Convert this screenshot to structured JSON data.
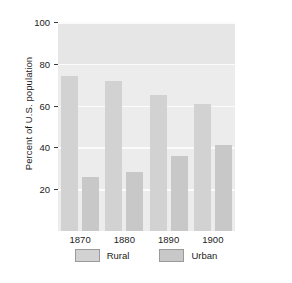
{
  "chart_data": {
    "type": "bar",
    "title": "",
    "xlabel": "",
    "ylabel": "Percent of U.S. population",
    "categories": [
      "1870",
      "1880",
      "1890",
      "1900"
    ],
    "series": [
      {
        "name": "Rural",
        "color": "#d2d2d2",
        "values": [
          74,
          72,
          65,
          61
        ]
      },
      {
        "name": "Urban",
        "color": "#c8c8c8",
        "values": [
          26,
          28,
          36,
          41
        ]
      }
    ],
    "ylim": [
      0,
      100
    ],
    "yticks": [
      20,
      40,
      60,
      80,
      100
    ],
    "ytick_labels": [
      "20",
      "40",
      "60",
      "80",
      "100"
    ],
    "grid": true,
    "legend_position": "bottom",
    "plot_background": "#ececec",
    "gridline_color": "#fbfbfb"
  }
}
